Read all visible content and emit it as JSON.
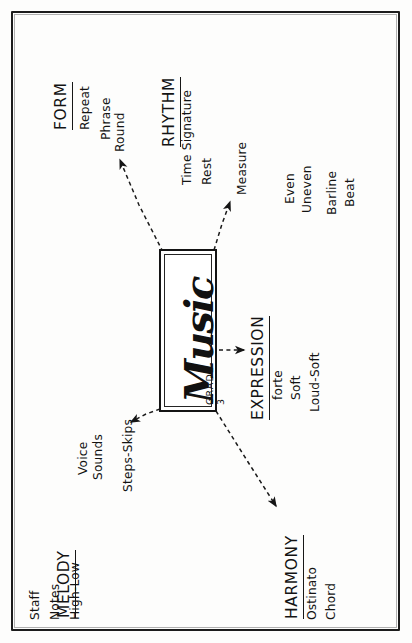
{
  "poster": {
    "title_card": {
      "grade": "GRADE-3",
      "subject": "Music"
    },
    "sections": [
      {
        "id": "form",
        "heading": "FORM",
        "terms": [
          "Repeat",
          "Phrase",
          "Round"
        ]
      },
      {
        "id": "rhythm",
        "heading": "RHYTHM",
        "terms": [
          "Time Signature",
          "Rest",
          "Measure",
          "Even",
          "Uneven",
          "Barline",
          "Beat"
        ]
      },
      {
        "id": "melody",
        "heading": "MELODY",
        "terms": [
          "Staff",
          "Notes",
          "High-Low",
          "Voice",
          "Sounds",
          "Steps-Skips"
        ]
      },
      {
        "id": "expression",
        "heading": "EXPRESSION",
        "terms": [
          "forte",
          "Soft",
          "Loud-Soft"
        ]
      },
      {
        "id": "harmony",
        "heading": "HARMONY",
        "terms": [
          "Ostinato",
          "Chord"
        ]
      }
    ],
    "colors": {
      "ink": "#141414",
      "paper": "#fdfdfc"
    }
  }
}
